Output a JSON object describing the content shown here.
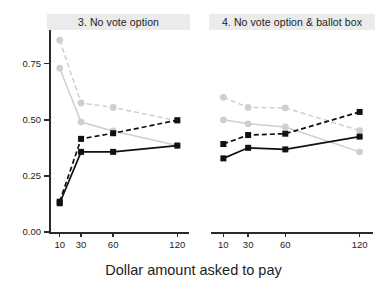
{
  "chart_data": {
    "type": "line",
    "title": "",
    "xlabel": "Dollar amount asked to pay",
    "ylabel": "",
    "x": [
      10,
      30,
      60,
      120
    ],
    "xtick_labels": [
      "10",
      "30",
      "60",
      "120"
    ],
    "ytick_labels": [
      "0.00",
      "0.25",
      "0.50",
      "0.75"
    ],
    "ytick_values": [
      0.0,
      0.25,
      0.5,
      0.75
    ],
    "ylim": [
      0.0,
      0.9
    ],
    "xlim": [
      0,
      130
    ],
    "grid": false,
    "legend": "none",
    "facets": [
      {
        "label": "3. No vote option",
        "series": [
          {
            "name": "light-dashed",
            "color": "#cfcfcf",
            "style": "dashed",
            "marker": "circle",
            "values": [
              0.855,
              0.575,
              0.555,
              0.495
            ]
          },
          {
            "name": "light-solid",
            "color": "#cfcfcf",
            "style": "solid",
            "marker": "circle",
            "values": [
              0.73,
              0.49,
              0.45,
              0.385
            ]
          },
          {
            "name": "dark-dashed",
            "color": "#111111",
            "style": "dashed",
            "marker": "square",
            "values": [
              0.135,
              0.415,
              0.44,
              0.498
            ]
          },
          {
            "name": "dark-solid",
            "color": "#111111",
            "style": "solid",
            "marker": "square",
            "values": [
              0.128,
              0.357,
              0.357,
              0.385
            ]
          }
        ]
      },
      {
        "label": "4. No vote option & ballot box",
        "series": [
          {
            "name": "light-dashed",
            "color": "#cfcfcf",
            "style": "dashed",
            "marker": "circle",
            "values": [
              0.6,
              0.555,
              0.553,
              0.452
            ]
          },
          {
            "name": "light-solid",
            "color": "#cfcfcf",
            "style": "solid",
            "marker": "circle",
            "values": [
              0.5,
              0.482,
              0.468,
              0.357
            ]
          },
          {
            "name": "dark-dashed",
            "color": "#111111",
            "style": "dashed",
            "marker": "square",
            "values": [
              0.392,
              0.432,
              0.438,
              0.535
            ]
          },
          {
            "name": "dark-solid",
            "color": "#111111",
            "style": "solid",
            "marker": "square",
            "values": [
              0.328,
              0.375,
              0.368,
              0.425
            ]
          }
        ]
      }
    ]
  },
  "layout": {
    "panel_left": {
      "x0": 49,
      "x1": 188,
      "y0": 232,
      "y1": 30
    },
    "panel_right": {
      "x0": 211,
      "x1": 372,
      "y0": 232,
      "y1": 30
    }
  }
}
